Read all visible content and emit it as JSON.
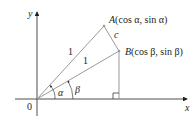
{
  "diagram": {
    "axes": {
      "x_label": "x",
      "y_label": "y",
      "origin_label": "0"
    },
    "points": {
      "A": {
        "name": "A",
        "coords": "(cos α, sin α)"
      },
      "B": {
        "name": "B",
        "coords": "(cos β, sin β)"
      }
    },
    "segments": {
      "OA_length": "1",
      "OB_length": "1",
      "AB_label": "c"
    },
    "angles": {
      "alpha": "α",
      "beta": "β"
    },
    "colors": {
      "line": "#9a9a9a",
      "axis": "#231f20",
      "text": "#231f20"
    }
  }
}
